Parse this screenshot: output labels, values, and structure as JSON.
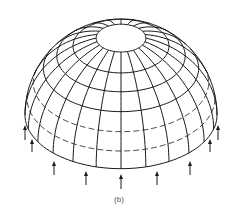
{
  "figure": {
    "caption": "(b)",
    "colors": {
      "line": "#1a1a1a",
      "background": "#ffffff",
      "caption": "#555555"
    },
    "geometry": {
      "center_x": 121,
      "center_y": 115,
      "radius": 96,
      "elevation_deg": 34,
      "meridian_step_deg": 15,
      "parallels_solid_deg": [
        0,
        36,
        48,
        60,
        75
      ],
      "parallels_dashed_deg": [
        12,
        24
      ],
      "top_opening_deg": 75
    },
    "arrows": [
      {
        "x": 25,
        "y1": 140,
        "y2": 125
      },
      {
        "x": 32,
        "y1": 152,
        "y2": 139
      },
      {
        "x": 54,
        "y1": 175,
        "y2": 161
      },
      {
        "x": 86,
        "y1": 185,
        "y2": 171
      },
      {
        "x": 121,
        "y1": 189,
        "y2": 174
      },
      {
        "x": 157,
        "y1": 185,
        "y2": 171
      },
      {
        "x": 190,
        "y1": 175,
        "y2": 161
      },
      {
        "x": 210,
        "y1": 152,
        "y2": 139
      },
      {
        "x": 218,
        "y1": 140,
        "y2": 125
      }
    ]
  }
}
